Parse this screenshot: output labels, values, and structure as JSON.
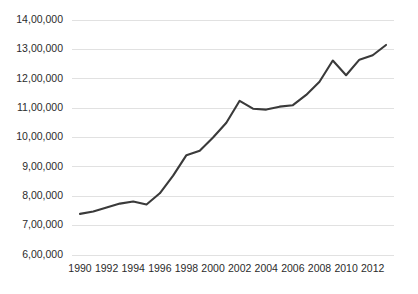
{
  "chart_data": {
    "type": "line",
    "title": "",
    "subtitle": "",
    "xlabel": "",
    "ylabel": "",
    "grid": "horizontal",
    "legend": "none",
    "line_color": "#3a3a3a",
    "grid_color": "#d9d9d9",
    "xlim": [
      1989.4,
      2013.6
    ],
    "ylim": [
      600000,
      1400000
    ],
    "y_ticks": [
      600000,
      700000,
      800000,
      900000,
      1000000,
      1100000,
      1200000,
      1300000,
      1400000
    ],
    "y_tick_labels": [
      "6,00,000",
      "7,00,000",
      "8,00,000",
      "9,00,000",
      "10,00,000",
      "11,00,000",
      "12,00,000",
      "13,00,000",
      "14,00,000"
    ],
    "x_ticks": [
      1990,
      1992,
      1994,
      1996,
      1998,
      2000,
      2002,
      2004,
      2006,
      2008,
      2010,
      2012
    ],
    "x_tick_labels": [
      "1990",
      "1992",
      "1994",
      "1996",
      "1998",
      "2000",
      "2002",
      "2004",
      "2006",
      "2008",
      "2010",
      "2012"
    ],
    "series": [
      {
        "name": "series-1",
        "color": "#3a3a3a",
        "x": [
          1990,
          1991,
          1992,
          1993,
          1994,
          1995,
          1996,
          1997,
          1998,
          1999,
          2000,
          2001,
          2002,
          2003,
          2004,
          2005,
          2006,
          2007,
          2008,
          2009,
          2010,
          2011,
          2012,
          2013
        ],
        "values": [
          740000,
          748000,
          762000,
          775000,
          782000,
          772000,
          810000,
          870000,
          940000,
          955000,
          1000000,
          1050000,
          1125000,
          1098000,
          1095000,
          1105000,
          1110000,
          1145000,
          1190000,
          1262000,
          1212000,
          1265000,
          1280000,
          1315000
        ]
      }
    ]
  },
  "axes": {
    "plot_left": 72,
    "plot_right": 394,
    "plot_top": 20,
    "plot_bottom": 255
  }
}
